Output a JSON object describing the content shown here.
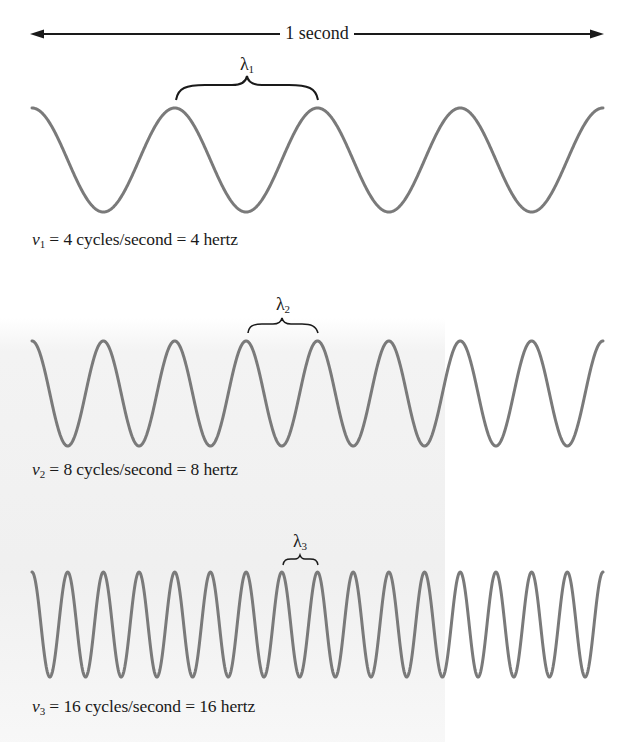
{
  "figure": {
    "duration_label": "1 second",
    "wave_color": "#7a7a7a",
    "annotation_color": "#1a1a1a",
    "waves": [
      {
        "id": "wave-1",
        "wavelength_symbol": "λ",
        "wavelength_subscript": "1",
        "frequency_symbol": "ν",
        "frequency_subscript": "1",
        "caption_rest": " = 4 cycles/second = 4 hertz",
        "cycles": 4
      },
      {
        "id": "wave-2",
        "wavelength_symbol": "λ",
        "wavelength_subscript": "2",
        "frequency_symbol": "ν",
        "frequency_subscript": "2",
        "caption_rest": " = 8 cycles/second = 8 hertz",
        "cycles": 8
      },
      {
        "id": "wave-3",
        "wavelength_symbol": "λ",
        "wavelength_subscript": "3",
        "frequency_symbol": "ν",
        "frequency_subscript": "3",
        "caption_rest": " = 16 cycles/second = 16 hertz",
        "cycles": 16
      }
    ]
  }
}
